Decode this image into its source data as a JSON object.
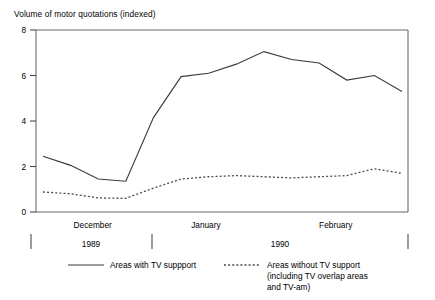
{
  "chart_data": {
    "type": "line",
    "title": "Volume of motor quotations (indexed)",
    "xlabel": "",
    "ylabel": "",
    "ylim": [
      0,
      8
    ],
    "yticks": [
      0,
      2,
      4,
      6,
      8
    ],
    "ytick_labels": [
      "0",
      "2",
      "4",
      "6",
      "8"
    ],
    "grid": false,
    "legend_position": "below",
    "x_category_labels": [
      "December",
      "January",
      "February"
    ],
    "year_labels": [
      "1989",
      "1990"
    ],
    "x": [
      0,
      1,
      2,
      3,
      4,
      5,
      6,
      7,
      8,
      9,
      10,
      11,
      12,
      13
    ],
    "series": [
      {
        "name": "Areas with TV suppport",
        "style": "solid",
        "color": "#3a3a3a",
        "values": [
          2.45,
          2.05,
          1.45,
          1.35,
          4.15,
          5.95,
          6.1,
          6.5,
          7.05,
          6.7,
          6.55,
          5.8,
          6.0,
          5.3
        ]
      },
      {
        "name": "Areas without TV support (including TV overlap areas and TV-am)",
        "style": "dotted",
        "color": "#4a4a4a",
        "values": [
          0.88,
          0.8,
          0.62,
          0.6,
          1.05,
          1.45,
          1.55,
          1.6,
          1.55,
          1.5,
          1.55,
          1.6,
          1.9,
          1.7
        ]
      }
    ]
  },
  "legend": {
    "entries": [
      {
        "label": "Areas with TV suppport",
        "swatch": "solid-line-swatch"
      },
      {
        "label_line1": "Areas without TV support",
        "label_line2": "(including TV overlap areas",
        "label_line3": "and TV-am)",
        "swatch": "dotted-line-swatch"
      }
    ]
  }
}
